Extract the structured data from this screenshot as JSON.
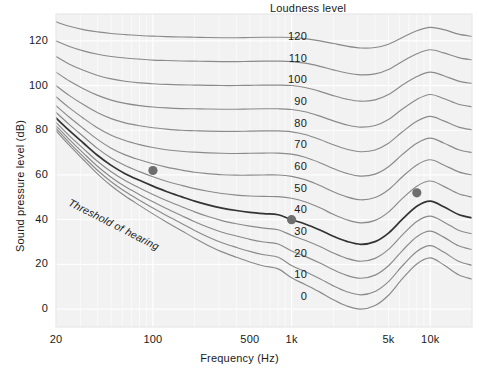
{
  "chart_data": {
    "type": "line",
    "title": "",
    "xlabel": "Frequency (Hz)",
    "ylabel": "Sound pressure level (dB)",
    "xscale": "log",
    "xlim": [
      20,
      20000
    ],
    "ylim": [
      -8,
      132
    ],
    "grid": true,
    "legend_position": "inline-labels",
    "legend_title": "Loudness level",
    "xticks": [
      {
        "value": 20,
        "label": "20"
      },
      {
        "value": 100,
        "label": "100"
      },
      {
        "value": 500,
        "label": "500"
      },
      {
        "value": 1000,
        "label": "1k"
      },
      {
        "value": 5000,
        "label": "5k"
      },
      {
        "value": 10000,
        "label": "10k"
      }
    ],
    "yticks": [
      {
        "value": 0,
        "label": "0"
      },
      {
        "value": 20,
        "label": "20"
      },
      {
        "value": 40,
        "label": "40"
      },
      {
        "value": 60,
        "label": "60"
      },
      {
        "value": 80,
        "label": "80"
      },
      {
        "value": 100,
        "label": "100"
      },
      {
        "value": 120,
        "label": "120"
      }
    ],
    "annotations": [
      {
        "text": "Threshold of hearing",
        "rotation": 27,
        "style": "italic"
      },
      {
        "text": "Loudness level",
        "rotation": 0,
        "style": "normal"
      }
    ],
    "series": [
      {
        "name": "120",
        "label": "120",
        "phon": 120,
        "highlight": false,
        "x": [
          20,
          25,
          31.5,
          40,
          50,
          63,
          80,
          100,
          125,
          160,
          200,
          250,
          315,
          400,
          500,
          630,
          800,
          1000,
          1250,
          1600,
          2000,
          2500,
          3150,
          4000,
          5000,
          6300,
          8000,
          10000,
          12500,
          16000,
          20000
        ],
        "y": [
          128.5,
          126.5,
          125.0,
          124.0,
          123.3,
          122.8,
          122.4,
          122.1,
          121.9,
          121.7,
          121.6,
          121.5,
          121.4,
          121.4,
          121.5,
          121.6,
          121.6,
          121.5,
          121.0,
          120.0,
          118.8,
          117.6,
          116.8,
          117.0,
          118.5,
          121.5,
          124.5,
          126.0,
          125.0,
          123.0,
          122.0
        ]
      },
      {
        "name": "110",
        "label": "110",
        "phon": 110,
        "highlight": false,
        "x": [
          20,
          25,
          31.5,
          40,
          50,
          63,
          80,
          100,
          125,
          160,
          200,
          250,
          315,
          400,
          500,
          630,
          800,
          1000,
          1250,
          1600,
          2000,
          2500,
          3150,
          4000,
          5000,
          6300,
          8000,
          10000,
          12500,
          16000,
          20000
        ],
        "y": [
          120.0,
          117.5,
          115.5,
          114.0,
          113.0,
          112.3,
          111.8,
          111.4,
          111.2,
          111.0,
          110.9,
          110.8,
          110.7,
          110.7,
          110.8,
          110.9,
          110.9,
          110.7,
          110.0,
          108.6,
          107.0,
          105.6,
          104.8,
          105.2,
          107.2,
          110.8,
          114.2,
          116.0,
          114.6,
          112.5,
          111.5
        ]
      },
      {
        "name": "100",
        "label": "100",
        "phon": 100,
        "highlight": false,
        "x": [
          20,
          25,
          31.5,
          40,
          50,
          63,
          80,
          100,
          125,
          160,
          200,
          250,
          315,
          400,
          500,
          630,
          800,
          1000,
          1250,
          1600,
          2000,
          2500,
          3150,
          4000,
          5000,
          6300,
          8000,
          10000,
          12500,
          16000,
          20000
        ],
        "y": [
          113.0,
          109.5,
          106.8,
          104.5,
          103.0,
          101.9,
          101.2,
          100.8,
          100.5,
          100.3,
          100.2,
          100.1,
          100.0,
          100.0,
          100.1,
          100.2,
          100.2,
          100.0,
          99.1,
          97.4,
          95.5,
          93.9,
          93.0,
          93.6,
          96.0,
          100.2,
          104.0,
          106.0,
          104.4,
          102.0,
          101.0
        ]
      },
      {
        "name": "90",
        "label": "90",
        "phon": 90,
        "highlight": false,
        "x": [
          20,
          25,
          31.5,
          40,
          50,
          63,
          80,
          100,
          125,
          160,
          200,
          250,
          315,
          400,
          500,
          630,
          800,
          1000,
          1250,
          1600,
          2000,
          2500,
          3150,
          4000,
          5000,
          6300,
          8000,
          10000,
          12500,
          16000,
          20000
        ],
        "y": [
          106.0,
          102.0,
          98.6,
          95.6,
          93.5,
          92.0,
          91.0,
          90.4,
          90.0,
          89.7,
          89.6,
          89.5,
          89.4,
          89.4,
          89.5,
          89.6,
          89.6,
          89.3,
          88.3,
          86.3,
          84.2,
          82.4,
          81.4,
          82.1,
          84.8,
          89.5,
          93.8,
          96.0,
          94.2,
          91.6,
          90.5
        ]
      },
      {
        "name": "80",
        "label": "80",
        "phon": 80,
        "highlight": false,
        "x": [
          20,
          25,
          31.5,
          40,
          50,
          63,
          80,
          100,
          125,
          160,
          200,
          250,
          315,
          400,
          500,
          630,
          800,
          1000,
          1250,
          1600,
          2000,
          2500,
          3150,
          4000,
          5000,
          6300,
          8000,
          10000,
          12500,
          16000,
          20000
        ],
        "y": [
          100.0,
          95.5,
          91.5,
          87.8,
          85.2,
          83.3,
          82.0,
          81.1,
          80.5,
          80.0,
          79.8,
          79.6,
          79.5,
          79.5,
          79.6,
          79.7,
          79.7,
          79.3,
          78.1,
          75.9,
          73.5,
          71.5,
          70.4,
          71.2,
          74.2,
          79.3,
          84.0,
          86.2,
          84.2,
          81.4,
          80.2
        ]
      },
      {
        "name": "70",
        "label": "70",
        "phon": 70,
        "highlight": false,
        "x": [
          20,
          25,
          31.5,
          40,
          50,
          63,
          80,
          100,
          125,
          160,
          200,
          250,
          315,
          400,
          500,
          630,
          800,
          1000,
          1250,
          1600,
          2000,
          2500,
          3150,
          4000,
          5000,
          6300,
          8000,
          10000,
          12500,
          16000,
          20000
        ],
        "y": [
          95.0,
          90.0,
          85.4,
          81.0,
          77.8,
          75.4,
          73.6,
          72.3,
          71.3,
          70.6,
          70.2,
          69.9,
          69.7,
          69.6,
          69.7,
          69.8,
          69.8,
          69.3,
          67.9,
          65.5,
          62.9,
          60.7,
          59.5,
          60.4,
          63.7,
          69.2,
          74.2,
          76.5,
          74.3,
          71.3,
          70.0
        ]
      },
      {
        "name": "60",
        "label": "60",
        "phon": 60,
        "highlight": false,
        "x": [
          20,
          25,
          31.5,
          40,
          50,
          63,
          80,
          100,
          125,
          160,
          200,
          250,
          315,
          400,
          500,
          630,
          800,
          1000,
          1250,
          1600,
          2000,
          2500,
          3150,
          4000,
          5000,
          6300,
          8000,
          10000,
          12500,
          16000,
          20000
        ],
        "y": [
          91.0,
          85.8,
          80.8,
          75.8,
          72.0,
          69.0,
          66.8,
          65.0,
          63.5,
          62.2,
          61.2,
          60.6,
          60.1,
          59.9,
          59.9,
          60.0,
          60.0,
          59.4,
          57.9,
          55.3,
          52.5,
          50.2,
          48.9,
          49.9,
          53.4,
          59.2,
          64.5,
          66.8,
          64.5,
          61.4,
          60.0
        ]
      },
      {
        "name": "50",
        "label": "50",
        "phon": 50,
        "highlight": false,
        "x": [
          20,
          25,
          31.5,
          40,
          50,
          63,
          80,
          100,
          125,
          160,
          200,
          250,
          315,
          400,
          500,
          630,
          800,
          1000,
          1250,
          1600,
          2000,
          2500,
          3150,
          4000,
          5000,
          6300,
          8000,
          10000,
          12500,
          16000,
          20000
        ],
        "y": [
          88.0,
          82.5,
          77.2,
          71.8,
          67.6,
          64.2,
          61.5,
          59.2,
          57.2,
          55.4,
          53.9,
          52.7,
          51.7,
          51.0,
          50.6,
          50.4,
          50.3,
          49.6,
          48.0,
          45.3,
          42.4,
          40.0,
          38.6,
          39.7,
          43.4,
          49.5,
          55.0,
          57.3,
          54.9,
          51.6,
          50.1
        ]
      },
      {
        "name": "40",
        "label": "40",
        "phon": 40,
        "highlight": true,
        "x": [
          20,
          25,
          31.5,
          40,
          50,
          63,
          80,
          100,
          125,
          160,
          200,
          250,
          315,
          400,
          500,
          630,
          800,
          1000,
          1250,
          1600,
          2000,
          2500,
          3150,
          4000,
          5000,
          6300,
          8000,
          10000,
          12500,
          16000,
          20000
        ],
        "y": [
          85.5,
          79.8,
          74.3,
          68.7,
          64.3,
          60.6,
          57.6,
          55.0,
          52.6,
          50.3,
          48.3,
          46.6,
          45.2,
          44.1,
          43.3,
          42.7,
          42.2,
          40.0,
          38.1,
          35.4,
          32.6,
          30.3,
          29.0,
          30.2,
          34.0,
          40.2,
          46.0,
          48.3,
          45.8,
          42.3,
          40.8
        ]
      },
      {
        "name": "30",
        "label": "30",
        "phon": 30,
        "highlight": false,
        "x": [
          20,
          25,
          31.5,
          40,
          50,
          63,
          80,
          100,
          125,
          160,
          200,
          250,
          315,
          400,
          500,
          630,
          800,
          1000,
          1250,
          1600,
          2000,
          2500,
          3150,
          4000,
          5000,
          6300,
          8000,
          10000,
          12500,
          16000,
          20000
        ],
        "y": [
          83.5,
          77.5,
          71.8,
          66.0,
          61.4,
          57.5,
          54.2,
          51.3,
          48.6,
          45.9,
          43.5,
          41.4,
          39.6,
          38.2,
          37.1,
          36.2,
          35.5,
          33.0,
          30.8,
          28.0,
          25.1,
          22.7,
          21.4,
          22.7,
          26.7,
          33.2,
          39.2,
          41.6,
          39.0,
          35.3,
          33.7
        ]
      },
      {
        "name": "20",
        "label": "20",
        "phon": 20,
        "highlight": false,
        "x": [
          20,
          25,
          31.5,
          40,
          50,
          63,
          80,
          100,
          125,
          160,
          200,
          250,
          315,
          400,
          500,
          630,
          800,
          1000,
          1250,
          1600,
          2000,
          2500,
          3150,
          4000,
          5000,
          6300,
          8000,
          10000,
          12500,
          16000,
          20000
        ],
        "y": [
          82.0,
          75.8,
          69.8,
          63.8,
          59.0,
          54.8,
          51.2,
          48.0,
          45.0,
          41.9,
          39.1,
          36.6,
          34.4,
          32.7,
          31.2,
          30.0,
          29.1,
          26.0,
          23.6,
          20.6,
          17.6,
          15.1,
          13.8,
          15.2,
          19.4,
          26.2,
          32.4,
          34.9,
          32.2,
          28.3,
          26.6
        ]
      },
      {
        "name": "10",
        "label": "10",
        "phon": 10,
        "highlight": false,
        "x": [
          20,
          25,
          31.5,
          40,
          50,
          63,
          80,
          100,
          125,
          160,
          200,
          250,
          315,
          400,
          500,
          630,
          800,
          1000,
          1250,
          1600,
          2000,
          2500,
          3150,
          4000,
          5000,
          6300,
          8000,
          10000,
          12500,
          16000,
          20000
        ],
        "y": [
          80.8,
          74.4,
          68.2,
          62.0,
          57.0,
          52.6,
          48.7,
          45.2,
          41.9,
          38.4,
          35.2,
          32.3,
          29.7,
          27.6,
          25.8,
          24.3,
          23.2,
          19.5,
          16.8,
          13.6,
          10.4,
          7.8,
          6.4,
          7.9,
          12.3,
          19.4,
          25.8,
          28.4,
          25.5,
          21.4,
          19.6
        ]
      },
      {
        "name": "0",
        "label": "0",
        "phon": 0,
        "highlight": false,
        "x": [
          20,
          25,
          31.5,
          40,
          50,
          63,
          80,
          100,
          125,
          160,
          200,
          250,
          315,
          400,
          500,
          630,
          800,
          1000,
          1250,
          1600,
          2000,
          2500,
          3150,
          4000,
          5000,
          6300,
          8000,
          10000,
          12500,
          16000,
          20000
        ],
        "y": [
          79.8,
          73.2,
          66.8,
          60.4,
          55.2,
          50.6,
          46.4,
          42.6,
          39.0,
          35.2,
          31.7,
          28.5,
          25.6,
          23.2,
          21.1,
          19.3,
          18.0,
          14.0,
          11.0,
          7.6,
          4.2,
          1.4,
          0.0,
          1.6,
          6.2,
          13.6,
          20.2,
          22.9,
          19.8,
          15.4,
          13.4
        ]
      }
    ],
    "markers": [
      {
        "name": "marker-100hz",
        "x": 100,
        "y": 62,
        "series": "40"
      },
      {
        "name": "marker-1khz",
        "x": 1000,
        "y": 40,
        "series": "40"
      },
      {
        "name": "marker-8khz",
        "x": 8000,
        "y": 52,
        "series": "40"
      }
    ],
    "colors": {
      "plot_background": "#f2f2f2",
      "gridline": "#ffffff",
      "contour": "#8a8a8a",
      "contour_highlight": "#333333",
      "marker": "#6e6e6e",
      "text": "#1a1a1a"
    }
  }
}
